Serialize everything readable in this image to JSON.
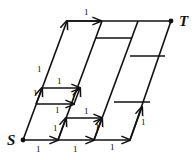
{
  "diagram": {
    "type": "directed lattice paths in a parallelogram grid",
    "nodes": {
      "source": {
        "label": "S",
        "x": 23,
        "y": 140
      },
      "target": {
        "label": "T",
        "x": 171,
        "y": 21
      }
    },
    "edge_label": "1",
    "arrow_edges": [
      {
        "from": [
          23,
          140
        ],
        "to": [
          58,
          140
        ],
        "label": "1",
        "lx": 36,
        "ly": 152
      },
      {
        "from": [
          58,
          140
        ],
        "to": [
          94,
          140
        ],
        "label": "1",
        "lx": 73,
        "ly": 152
      },
      {
        "from": [
          94,
          140
        ],
        "to": [
          130,
          140
        ],
        "label": "1",
        "lx": 110,
        "ly": 150
      },
      {
        "from": [
          23,
          140
        ],
        "to": [
          67,
          21
        ],
        "label": "1",
        "lx": 37,
        "ly": 72
      },
      {
        "from": [
          67,
          21
        ],
        "to": [
          101,
          21
        ],
        "label": "1",
        "lx": 84,
        "ly": 15
      },
      {
        "from": [
          36,
          104
        ],
        "to": [
          74,
          104
        ],
        "label": "1",
        "lx": 55,
        "ly": 113
      },
      {
        "from": [
          42,
          88
        ],
        "to": [
          80,
          88
        ],
        "label": "1",
        "lx": 57,
        "ly": 84
      },
      {
        "from": [
          58,
          140
        ],
        "to": [
          66,
          118
        ],
        "label": "1",
        "lx": 53,
        "ly": 131
      },
      {
        "from": [
          66,
          118
        ],
        "to": [
          102,
          118
        ],
        "label": "1",
        "lx": 84,
        "ly": 114
      },
      {
        "from": [
          94,
          140
        ],
        "to": [
          102,
          118
        ],
        "label": "1",
        "lx": 95,
        "ly": 130
      },
      {
        "from": [
          130,
          140
        ],
        "to": [
          142,
          107
        ],
        "label": "1",
        "lx": 141,
        "ly": 125
      },
      {
        "from": [
          74,
          104
        ],
        "to": [
          80,
          88
        ],
        "label": "1",
        "lx": 71,
        "ly": 100
      },
      {
        "from": [
          36,
          104
        ],
        "to": [
          42,
          88
        ],
        "label": "1",
        "lx": 33,
        "ly": 96
      }
    ],
    "plain_edges": [
      {
        "from": [
          67,
          21
        ],
        "to": [
          171,
          21
        ]
      },
      {
        "from": [
          58,
          140
        ],
        "to": [
          102,
          21
        ]
      },
      {
        "from": [
          94,
          140
        ],
        "to": [
          138,
          21
        ]
      },
      {
        "from": [
          130,
          140
        ],
        "to": [
          171,
          21
        ]
      },
      {
        "from": [
          96,
          38
        ],
        "to": [
          132,
          38
        ]
      },
      {
        "from": [
          130,
          56
        ],
        "to": [
          165,
          56
        ]
      },
      {
        "from": [
          114,
          102
        ],
        "to": [
          150,
          102
        ]
      }
    ]
  }
}
